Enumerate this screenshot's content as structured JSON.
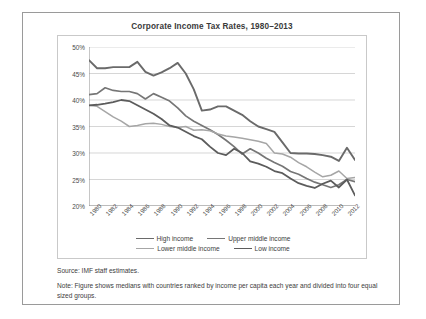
{
  "figure": {
    "title": "Corporate Income Tax Rates, 1980–2013",
    "source": "Source: IMF staff estimates.",
    "note": "Note: Figure shows medians with countries ranked by income per capita each year and divided into four equal sized groups."
  },
  "chart_data": {
    "type": "line",
    "title": "Corporate Income Tax Rates, 1980–2013",
    "xlabel": "",
    "ylabel": "",
    "ylim": [
      20,
      50
    ],
    "ytick_labels": [
      "20%",
      "25%",
      "30%",
      "35%",
      "40%",
      "45%",
      "50%"
    ],
    "ytick_values": [
      20,
      25,
      30,
      35,
      40,
      45,
      50
    ],
    "grid": true,
    "legend_position": "bottom",
    "x": [
      1980,
      1981,
      1982,
      1983,
      1984,
      1985,
      1986,
      1987,
      1988,
      1989,
      1990,
      1991,
      1992,
      1993,
      1994,
      1995,
      1996,
      1997,
      1998,
      1999,
      2000,
      2001,
      2002,
      2003,
      2004,
      2005,
      2006,
      2007,
      2008,
      2009,
      2010,
      2011,
      2012,
      2013
    ],
    "xtick_labels": [
      "1980",
      "1982",
      "1984",
      "1986",
      "1988",
      "1990",
      "1992",
      "1994",
      "1996",
      "1998",
      "2000",
      "2002",
      "2004",
      "2006",
      "2008",
      "2010",
      "2012"
    ],
    "series": [
      {
        "name": "High income",
        "color": "#6a6a6a",
        "width": 1.9,
        "values": [
          47.5,
          46.0,
          46.0,
          46.2,
          46.2,
          46.2,
          47.2,
          45.3,
          44.6,
          45.2,
          46.0,
          47.0,
          45.0,
          42.0,
          38.0,
          38.2,
          38.8,
          38.8,
          38.0,
          37.2,
          36.0,
          35.0,
          34.5,
          34.0,
          32.0,
          30.0,
          29.9,
          29.9,
          29.8,
          29.6,
          29.3,
          28.5,
          31.0,
          28.7
        ]
      },
      {
        "name": "Upper middle income",
        "color": "#767676",
        "width": 1.7,
        "values": [
          41.0,
          41.2,
          42.3,
          41.8,
          41.6,
          41.6,
          41.2,
          40.2,
          41.2,
          40.5,
          39.8,
          38.5,
          37.0,
          36.0,
          35.2,
          34.4,
          33.5,
          32.4,
          31.2,
          29.8,
          30.8,
          30.0,
          29.0,
          28.2,
          27.5,
          26.5,
          26.0,
          25.2,
          24.5,
          24.0,
          23.5,
          24.0,
          25.0,
          24.6
        ]
      },
      {
        "name": "Lower middle income",
        "color": "#a6a6a6",
        "width": 1.5,
        "values": [
          39.0,
          38.8,
          37.8,
          36.8,
          36.0,
          35.0,
          35.2,
          35.5,
          35.6,
          35.4,
          35.0,
          34.8,
          35.0,
          34.3,
          34.4,
          34.2,
          33.6,
          33.2,
          33.0,
          32.8,
          32.5,
          32.2,
          31.8,
          30.0,
          29.8,
          29.2,
          28.2,
          27.4,
          26.4,
          25.5,
          25.8,
          26.6,
          25.2,
          25.4
        ]
      },
      {
        "name": "Low income",
        "color": "#5c5c5c",
        "width": 1.8,
        "values": [
          39.0,
          39.1,
          39.3,
          39.6,
          40.0,
          39.8,
          39.0,
          38.2,
          37.4,
          36.4,
          35.2,
          34.8,
          34.0,
          33.2,
          32.6,
          31.2,
          30.0,
          29.6,
          30.8,
          30.0,
          28.4,
          28.0,
          27.4,
          26.6,
          26.2,
          25.2,
          24.3,
          23.8,
          23.4,
          24.2,
          24.8,
          23.5,
          25.0,
          22.0
        ]
      }
    ]
  }
}
